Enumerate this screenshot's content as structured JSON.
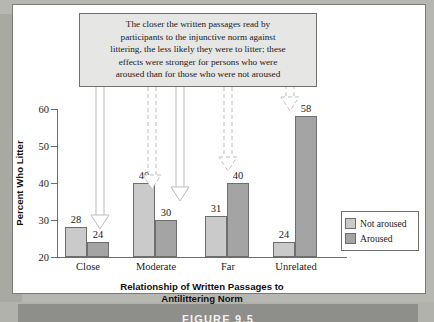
{
  "figure": {
    "bar_label": "FIGURE 9.5"
  },
  "annotation": {
    "lines": [
      "The closer the written passages read by",
      "participants to the injunctive norm against",
      "littering, the less likely they were to litter; these",
      "effects were stronger for persons who were",
      "aroused than for those who were not aroused"
    ]
  },
  "legend": {
    "items": [
      {
        "label": "Not aroused",
        "color": "#cacaca"
      },
      {
        "label": "Aroused",
        "color": "#a4a4a4"
      }
    ]
  },
  "axes": {
    "ylabel": "Percent Who Litter",
    "xlabel_line1": "Relationship of Written Passages to",
    "xlabel_line2": "Antilittering Norm",
    "yticks": [
      "20",
      "30",
      "40",
      "50",
      "60"
    ]
  },
  "chart_data": {
    "type": "bar",
    "title": "",
    "categories": [
      "Close",
      "Moderate",
      "Far",
      "Unrelated"
    ],
    "series": [
      {
        "name": "Not aroused",
        "values": [
          28,
          40,
          31,
          24
        ],
        "color": "#cacaca"
      },
      {
        "name": "Aroused",
        "values": [
          24,
          30,
          40,
          58
        ],
        "color": "#a4a4a4"
      }
    ],
    "xlabel": "Relationship of Written Passages to Antilittering Norm",
    "ylabel": "Percent Who Litter",
    "ylim": [
      20,
      60
    ],
    "ytick_step": 10,
    "grid": false,
    "legend_position": "right",
    "value_labels": true,
    "annotations": [
      {
        "text": "The closer the written passages read by participants to the injunctive norm against littering, the less likely they were to litter; these effects were stronger for persons who were aroused than for those who were not aroused",
        "points_to": [
          "Close/Aroused",
          "Moderate/Not aroused",
          "Moderate/Aroused",
          "Far/Aroused",
          "Unrelated/Aroused"
        ]
      }
    ]
  }
}
